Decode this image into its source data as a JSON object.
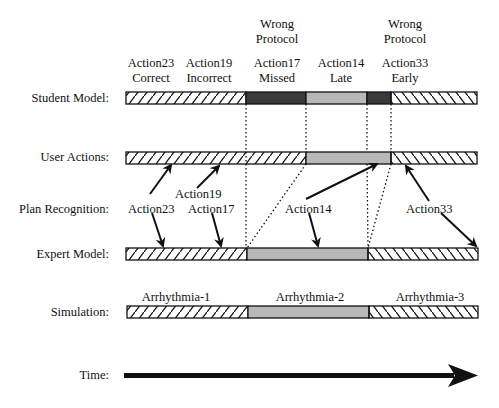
{
  "rows": {
    "student": "Student Model:",
    "user": "User Actions:",
    "plan": "Plan Recognition:",
    "expert": "Expert Model:",
    "simulation": "Simulation:",
    "time": "Time:"
  },
  "top_labels": [
    {
      "line1": "Action23",
      "line2": "Correct"
    },
    {
      "line1": "Action19",
      "line2": "Incorrect"
    },
    {
      "pre1": "Wrong",
      "pre2": "Protocol",
      "line1": "Action17",
      "line2": "Missed"
    },
    {
      "line1": "Action14",
      "line2": "Late"
    },
    {
      "pre1": "Wrong",
      "pre2": "Protocol",
      "line1": "Action33",
      "line2": "Early"
    }
  ],
  "plan_labels": {
    "a23": "Action23",
    "a19": "Action19",
    "a17": "Action17",
    "a14": "Action14",
    "a33": "Action33"
  },
  "simulation_labels": [
    "Arrhythmia-1",
    "Arrhythmia-2",
    "Arrhythmia-3"
  ],
  "colors": {
    "dark": "#3a3a3a",
    "gray": "#b8b8b8",
    "line": "#111111"
  }
}
